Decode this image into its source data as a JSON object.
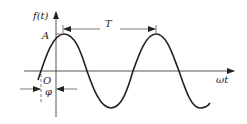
{
  "diagram": {
    "type": "sine-wave",
    "labels": {
      "y_axis": "f(t)",
      "x_axis": "ωt",
      "amplitude": "A",
      "origin": "O",
      "phase": "φ",
      "period": "T"
    },
    "colors": {
      "stroke": "#222222",
      "background": "#ffffff"
    }
  }
}
